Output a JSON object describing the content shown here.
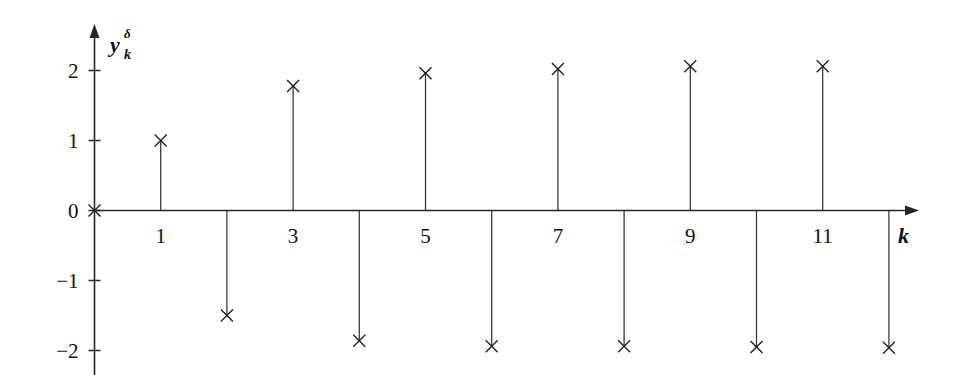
{
  "figure": {
    "background": "#ffffff",
    "ink_color": "#1f1f1f",
    "y_axis_label_base": "y",
    "y_axis_label_subscript": "k",
    "y_axis_label_superscript": "δ",
    "x_axis_label": "k"
  },
  "chart_data": {
    "type": "line",
    "plot_style": "stem",
    "title": "",
    "xlabel": "k",
    "ylabel": "y_k^δ",
    "x": [
      0,
      1,
      2,
      3,
      4,
      5,
      6,
      7,
      8,
      9,
      10,
      11,
      12
    ],
    "values": [
      0,
      1.0,
      -1.5,
      1.78,
      -1.86,
      1.96,
      -1.94,
      2.02,
      -1.94,
      2.06,
      -1.95,
      2.06,
      -1.96
    ],
    "series": [
      {
        "name": "y_k^delta",
        "marker": "x",
        "values": [
          0,
          1.0,
          -1.5,
          1.78,
          -1.86,
          1.96,
          -1.94,
          2.02,
          -1.94,
          2.06,
          -1.95,
          2.06,
          -1.96
        ]
      }
    ],
    "xlim": [
      0,
      12.8
    ],
    "ylim": [
      -2.3,
      2.35
    ],
    "grid": false,
    "legend": false,
    "legend_position": "none",
    "x_ticks": [
      1,
      3,
      5,
      7,
      9,
      11
    ],
    "x_tick_labels": [
      "1",
      "3",
      "5",
      "7",
      "9",
      "11"
    ],
    "x_tick_minor": [
      2,
      4,
      6,
      8,
      10,
      12
    ],
    "y_ticks": [
      2,
      1,
      0,
      -1,
      -2
    ],
    "y_tick_labels": [
      "2",
      "1",
      "0",
      "−1",
      "−2"
    ],
    "annotations": []
  },
  "axes": {
    "y_ticks": [
      {
        "value": 2,
        "label": "2"
      },
      {
        "value": 1,
        "label": "1"
      },
      {
        "value": 0,
        "label": "0"
      },
      {
        "value": -1,
        "label": "−1"
      },
      {
        "value": -2,
        "label": "−2"
      }
    ],
    "x_ticks": [
      {
        "value": 1,
        "label": "1"
      },
      {
        "value": 3,
        "label": "3"
      },
      {
        "value": 5,
        "label": "5"
      },
      {
        "value": 7,
        "label": "7"
      },
      {
        "value": 9,
        "label": "9"
      },
      {
        "value": 11,
        "label": "11"
      }
    ]
  }
}
